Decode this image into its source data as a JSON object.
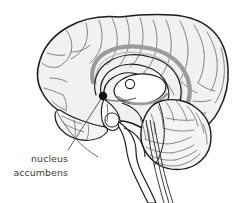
{
  "figure": {
    "kind": "anatomical-illustration",
    "background_color": "#ffffff",
    "width": 249,
    "height": 203
  },
  "palette": {
    "outline_dark": "#1c1c1c",
    "outline_mid": "#555555",
    "sulci_line": "#7a7a7a",
    "cortex_fill": "#f1f1f1",
    "cerebellum_fill": "#f4f4f4",
    "band_gray": "#9b9b9b",
    "band_gray_light": "#b8b8b8",
    "marker_fill": "#111111",
    "leader_line": "#4a4a4a",
    "text_color": "#3a3a3a",
    "white_fill": "#ffffff"
  },
  "annotation": {
    "marker": {
      "name": "nucleus-accumbens-marker",
      "shape": "filled-circle",
      "cx": 103,
      "cy": 96,
      "r": 4.2,
      "color": "#111111"
    },
    "leader": {
      "name": "leader-line",
      "from_x": 101,
      "from_y": 99,
      "to_x": 68,
      "to_y": 150,
      "color": "#4a4a4a"
    },
    "label": {
      "line1": "nucleus",
      "line2": "accumbens",
      "anchor_x": 68,
      "line1_y": 162,
      "line2_y": 176,
      "align": "right",
      "font_size": 9.4
    }
  },
  "structures": [
    {
      "id": "cerebral-cortex",
      "label": "cerebral cortex"
    },
    {
      "id": "corpus-callosum",
      "label": "corpus callosum"
    },
    {
      "id": "cingulate-gyrus",
      "label": "cingulate gyrus"
    },
    {
      "id": "thalamus",
      "label": "thalamus"
    },
    {
      "id": "hypothalamus",
      "label": "hypothalamus"
    },
    {
      "id": "cerebellum",
      "label": "cerebellum"
    },
    {
      "id": "brainstem",
      "label": "brainstem"
    },
    {
      "id": "spinal-cord",
      "label": "spinal cord"
    },
    {
      "id": "nucleus-accumbens",
      "label": "nucleus accumbens"
    }
  ]
}
